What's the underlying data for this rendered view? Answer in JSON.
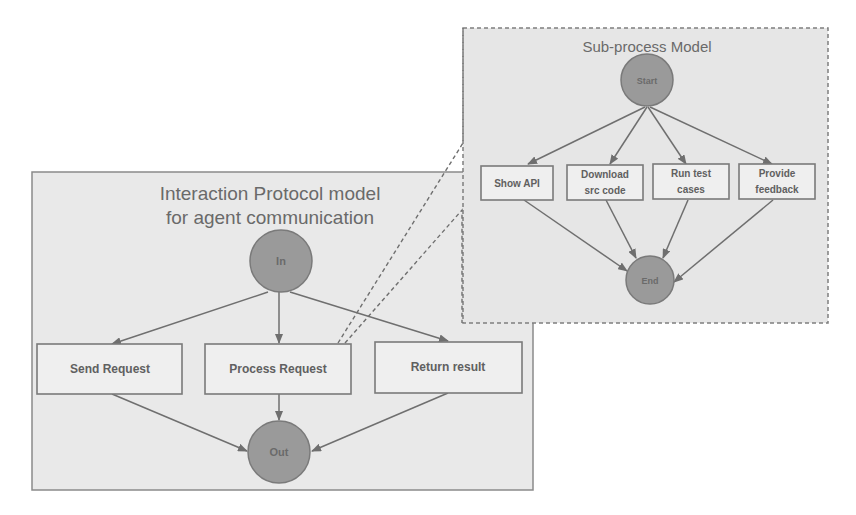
{
  "main_model": {
    "title_line1": "Interaction Protocol model",
    "title_line2": "for agent communication",
    "start_node": "In",
    "end_node": "Out",
    "steps": [
      {
        "label": "Send Request"
      },
      {
        "label": "Process Request"
      },
      {
        "label": "Return result"
      }
    ]
  },
  "sub_model": {
    "title": "Sub-process Model",
    "start_node": "Start",
    "end_node": "End",
    "steps": [
      {
        "line1": "Show API",
        "line2": ""
      },
      {
        "line1": "Download",
        "line2": "src code"
      },
      {
        "line1": "Run test",
        "line2": "cases"
      },
      {
        "line1": "Provide",
        "line2": "feedback"
      }
    ]
  },
  "colors": {
    "frame_fill": "#e9e9e9",
    "node_fill": "#9a9a9a",
    "stroke": "#7a7a7a",
    "text": "#606060"
  }
}
